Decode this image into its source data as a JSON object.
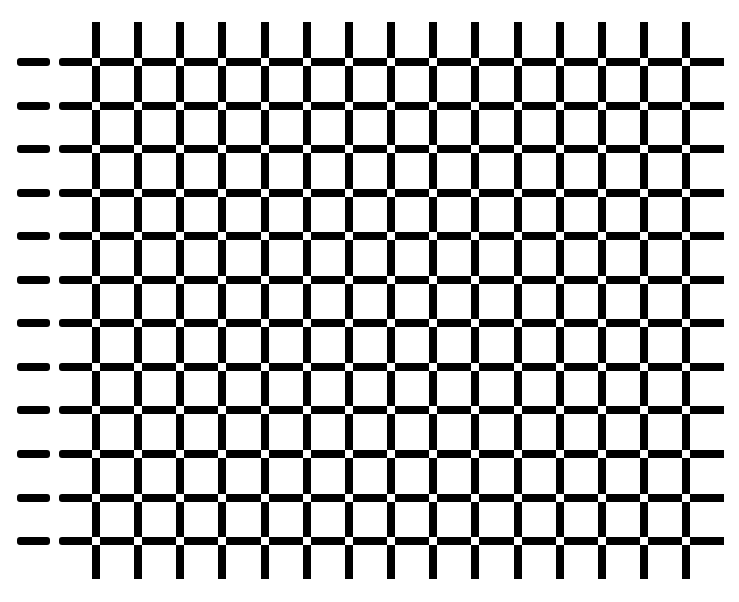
{
  "figure": {
    "title": "",
    "type": "grid-illusion",
    "background": "#ffffff",
    "line_color": "#000000",
    "intersection_color": "#ffffff",
    "line_thickness": 8,
    "vertical_lines": {
      "count": 15,
      "first_left": 92,
      "spacing": 42.15,
      "top": 22,
      "bottom": 579
    },
    "horizontal_lines": {
      "count": 12,
      "first_top": 58,
      "spacing": 43.55,
      "left": 59,
      "right": 724
    },
    "left_dashes": {
      "count": 12,
      "left": 17,
      "right": 50
    },
    "intersection_square": 8
  }
}
